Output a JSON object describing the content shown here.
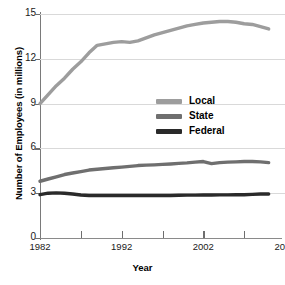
{
  "chart_data": {
    "type": "line",
    "title": "",
    "xlabel": "Year",
    "ylabel": "Number of Employees (in millions)",
    "xlim": [
      1982,
      2012
    ],
    "ylim": [
      0,
      15
    ],
    "grid": true,
    "legend_position": "center",
    "y_ticks": [
      0,
      3,
      6,
      9,
      12,
      15
    ],
    "y_tick_labels": [
      "0",
      "3",
      "6",
      "9",
      "12",
      "15"
    ],
    "x_ticks": [
      1982,
      1987,
      1992,
      1997,
      2002,
      2007,
      2012
    ],
    "x_tick_labels": [
      "1982",
      "",
      "1992",
      "",
      "2002",
      "",
      "2012"
    ],
    "x_labeled_ticks": [
      {
        "value": 1982,
        "label": "1982"
      },
      {
        "value": 1992,
        "label": "1992"
      },
      {
        "value": 2002,
        "label": "2002"
      },
      {
        "value": 2012,
        "label": "2012"
      }
    ],
    "x": [
      1982,
      1983,
      1984,
      1985,
      1986,
      1987,
      1988,
      1989,
      1990,
      1991,
      1992,
      1993,
      1994,
      1995,
      1996,
      1997,
      1998,
      1999,
      2000,
      2001,
      2002,
      2003,
      2004,
      2005,
      2006,
      2007,
      2008,
      2009,
      2010
    ],
    "series": [
      {
        "name": "Local",
        "color": "#9d9d9d",
        "values": [
          9.0,
          9.6,
          10.2,
          10.7,
          11.3,
          11.8,
          12.4,
          12.9,
          13.0,
          13.1,
          13.15,
          13.1,
          13.2,
          13.4,
          13.6,
          13.75,
          13.9,
          14.05,
          14.2,
          14.3,
          14.4,
          14.45,
          14.5,
          14.5,
          14.45,
          14.35,
          14.3,
          14.15,
          14.0
        ]
      },
      {
        "name": "State",
        "color": "#6f6f6f",
        "values": [
          3.8,
          3.95,
          4.1,
          4.25,
          4.35,
          4.45,
          4.55,
          4.6,
          4.65,
          4.7,
          4.75,
          4.8,
          4.85,
          4.88,
          4.9,
          4.93,
          4.96,
          5.0,
          5.03,
          5.08,
          5.12,
          4.98,
          5.05,
          5.08,
          5.1,
          5.12,
          5.12,
          5.1,
          5.05
        ]
      },
      {
        "name": "Federal",
        "color": "#2a2a2a",
        "values": [
          2.9,
          3.0,
          3.02,
          3.0,
          2.95,
          2.88,
          2.85,
          2.85,
          2.85,
          2.85,
          2.85,
          2.85,
          2.85,
          2.85,
          2.85,
          2.85,
          2.85,
          2.86,
          2.87,
          2.87,
          2.88,
          2.88,
          2.89,
          2.89,
          2.9,
          2.9,
          2.92,
          2.95,
          2.95
        ]
      }
    ]
  },
  "legend": {
    "items": [
      {
        "label": "Local",
        "color": "#9d9d9d"
      },
      {
        "label": "State",
        "color": "#6f6f6f"
      },
      {
        "label": "Federal",
        "color": "#2a2a2a"
      }
    ]
  },
  "axes": {
    "x_title": "Year",
    "y_title": "Number of Employees (in millions)"
  }
}
